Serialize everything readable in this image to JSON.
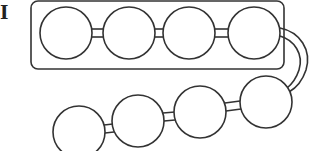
{
  "figure": {
    "panel_label": "I",
    "stroke_color": "#333333",
    "fill_color": "#ffffff",
    "enclosure": {
      "x": 31,
      "y": 1,
      "width": 253,
      "height": 68,
      "rx": 7
    },
    "top_row": [
      {
        "cx": 66,
        "cy": 33,
        "r": 26
      },
      {
        "cx": 129,
        "cy": 33,
        "r": 26
      },
      {
        "cx": 189,
        "cy": 33,
        "r": 26
      },
      {
        "cx": 254,
        "cy": 33,
        "r": 26
      }
    ],
    "bottom_row": [
      {
        "cx": 79,
        "cy": 132,
        "r": 26
      },
      {
        "cx": 138,
        "cy": 121,
        "r": 26
      },
      {
        "cx": 200,
        "cy": 112,
        "r": 26
      },
      {
        "cx": 266,
        "cy": 102,
        "r": 26
      }
    ]
  }
}
